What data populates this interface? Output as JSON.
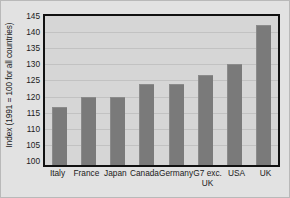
{
  "chart_data": {
    "type": "bar",
    "title": "",
    "subtitle": "",
    "xlabel": "",
    "ylabel": "Index (1991 = 100 for all countries)",
    "categories": [
      "Italy",
      "France",
      "Japan",
      "Canada",
      "Germany",
      "G7 exc.\nUK",
      "USA",
      "UK"
    ],
    "values": [
      118,
      121,
      121,
      125,
      125,
      128,
      131.5,
      143.5
    ],
    "ylim": [
      100,
      145
    ],
    "yticks": [
      100,
      105,
      110,
      115,
      120,
      125,
      130,
      135,
      140,
      145
    ],
    "ytick_labels": [
      "100",
      "105",
      "110",
      "115",
      "120",
      "125",
      "130",
      "135",
      "140",
      "145"
    ],
    "grid": true,
    "grid_axis": "y",
    "legend": false,
    "legend_position": "none",
    "bar_color": "#7a7a7a",
    "plot_background": "#d6d6d6",
    "figure_background": "#e2e2e2",
    "frame_color": "#111111",
    "gridline_color": "#c2c2c2",
    "text_color": "#1a1a1a"
  }
}
